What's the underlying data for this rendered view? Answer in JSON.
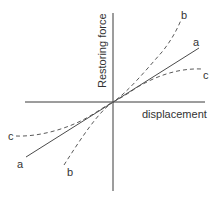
{
  "diagram": {
    "title": "",
    "axes": {
      "y_label": "Restoring force",
      "x_label": "displacement"
    },
    "curves": [
      {
        "id": "a",
        "label": "a",
        "style": "solid",
        "description": "linear"
      },
      {
        "id": "b",
        "label": "b",
        "style": "dashed",
        "description": "stiffening (hardening)"
      },
      {
        "id": "c",
        "label": "c",
        "style": "dashed",
        "description": "softening"
      }
    ],
    "colors": {
      "axis": "#3a3a3a",
      "line": "#4a4a4a",
      "text": "#333333",
      "background": "#ffffff"
    }
  }
}
